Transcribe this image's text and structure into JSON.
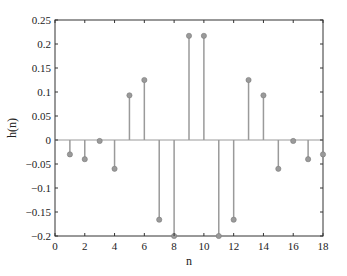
{
  "chart_data": {
    "type": "stem",
    "title": "",
    "xlabel": "n",
    "ylabel": "h(n)",
    "xlim": [
      0,
      18
    ],
    "ylim": [
      -0.2,
      0.25
    ],
    "xticks": [
      0,
      2,
      4,
      6,
      8,
      10,
      12,
      14,
      16,
      18
    ],
    "xtick_labels": [
      "0",
      "2",
      "4",
      "6",
      "8",
      "10",
      "12",
      "14",
      "16",
      "18"
    ],
    "yticks": [
      -0.2,
      -0.15,
      -0.1,
      -0.05,
      0,
      0.05,
      0.1,
      0.15,
      0.2,
      0.25
    ],
    "ytick_labels": [
      "−0.2",
      "−0.15",
      "−0.1",
      "−0.05",
      "0",
      "0.05",
      "0.1",
      "0.15",
      "0.2",
      "0.25"
    ],
    "grid": false,
    "legend": null,
    "series": [
      {
        "name": "h(n)",
        "color": "#9a9a9a",
        "x": [
          1,
          2,
          3,
          4,
          5,
          6,
          7,
          8,
          9,
          10,
          11,
          12,
          13,
          14,
          15,
          16,
          17,
          18
        ],
        "values": [
          -0.03,
          -0.04,
          -0.002,
          -0.06,
          0.093,
          0.125,
          -0.166,
          -0.2,
          0.217,
          0.217,
          -0.2,
          -0.166,
          0.125,
          0.093,
          -0.06,
          -0.002,
          -0.04,
          -0.03
        ]
      }
    ]
  }
}
